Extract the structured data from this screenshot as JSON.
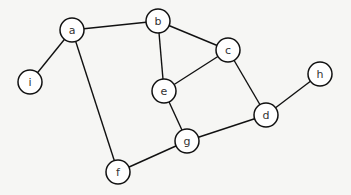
{
  "diagram": {
    "type": "undirected-graph",
    "node_radius": 12,
    "colors": {
      "background": "#f6f6f4",
      "stroke": "#111111",
      "label": "#333333",
      "node_fill": "#ffffff"
    },
    "nodes": [
      {
        "id": "a",
        "label": "a",
        "x": 72,
        "y": 30
      },
      {
        "id": "b",
        "label": "b",
        "x": 158,
        "y": 21
      },
      {
        "id": "c",
        "label": "c",
        "x": 228,
        "y": 50
      },
      {
        "id": "h",
        "label": "h",
        "x": 320,
        "y": 74
      },
      {
        "id": "i",
        "label": "i",
        "x": 30,
        "y": 82
      },
      {
        "id": "e",
        "label": "e",
        "x": 164,
        "y": 91
      },
      {
        "id": "d",
        "label": "d",
        "x": 266,
        "y": 115
      },
      {
        "id": "g",
        "label": "g",
        "x": 187,
        "y": 141
      },
      {
        "id": "f",
        "label": "f",
        "x": 118,
        "y": 172
      }
    ],
    "edges": [
      {
        "from": "a",
        "to": "b"
      },
      {
        "from": "a",
        "to": "i"
      },
      {
        "from": "a",
        "to": "f"
      },
      {
        "from": "b",
        "to": "e"
      },
      {
        "from": "b",
        "to": "c"
      },
      {
        "from": "c",
        "to": "e"
      },
      {
        "from": "c",
        "to": "d"
      },
      {
        "from": "e",
        "to": "g"
      },
      {
        "from": "d",
        "to": "g"
      },
      {
        "from": "d",
        "to": "h"
      },
      {
        "from": "f",
        "to": "g"
      }
    ]
  }
}
